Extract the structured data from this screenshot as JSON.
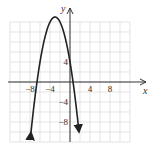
{
  "chart_data": {
    "type": "line",
    "title": "",
    "xlabel": "x",
    "ylabel": "y",
    "xlim": [
      -12,
      12
    ],
    "ylim": [
      -12,
      12
    ],
    "grid": true,
    "grid_step": 2,
    "x_ticks": [
      {
        "value": -8,
        "label": "−8"
      },
      {
        "value": -4,
        "label": "−4"
      },
      {
        "value": 4,
        "label": "4"
      },
      {
        "value": 8,
        "label": "8"
      }
    ],
    "y_ticks": [
      {
        "value": 4,
        "label": "4"
      },
      {
        "value": -4,
        "label": "−4"
      },
      {
        "value": -8,
        "label": "−8"
      }
    ],
    "series": [
      {
        "name": "parabola",
        "equation": "y = -x^2 - 6x + 4",
        "vertex": [
          -3,
          13
        ],
        "y_intercept": 4,
        "x_intercepts": [
          -6.6,
          0.6
        ],
        "opens": "down",
        "arrows_at_ends": true
      }
    ]
  },
  "labels": {
    "x_axis": "x",
    "y_axis": "y"
  },
  "colors": {
    "grid": "#d8d8d8",
    "axis": "#333333",
    "curve": "#222222"
  }
}
